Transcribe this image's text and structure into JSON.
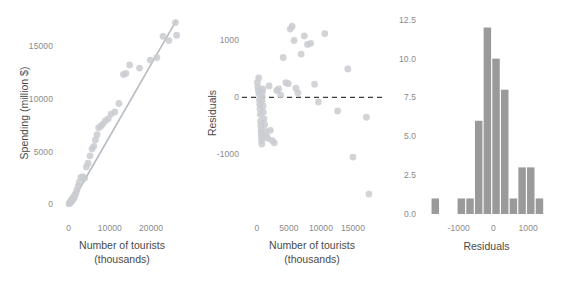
{
  "figure": {
    "background": "#ffffff",
    "point_color": "#c9cbd0",
    "line_color": "#b7bbc2",
    "bar_color": "#9a9a9a",
    "ref_line_color": "#3d3d3d",
    "tick_color": "#8a8a8a",
    "title_color": "#4a4a4a"
  },
  "chart_data": [
    {
      "id": "panel-scatter",
      "type": "scatter",
      "title": "",
      "xlabel": "Number of tourists",
      "xlabel_sub": "(thousands)",
      "ylabel": "Spending (million $)",
      "xticks": [
        0,
        10000,
        20000
      ],
      "xtick_labels": [
        "0",
        "10000",
        "20000"
      ],
      "yticks": [
        0,
        5000,
        10000,
        15000
      ],
      "ytick_labels": [
        "0",
        "5000",
        "10000",
        "15000"
      ],
      "xlim": [
        -1600,
        27500
      ],
      "ylim": [
        -900,
        18200
      ],
      "grid": false,
      "has_fit_line": true,
      "fit_line": {
        "x0": 300,
        "y0": -120,
        "x1": 26200,
        "y1": 17450
      },
      "x": [
        120,
        250,
        330,
        420,
        520,
        610,
        700,
        820,
        900,
        1050,
        1200,
        1350,
        1500,
        1750,
        1980,
        2300,
        2600,
        3000,
        3400,
        3900,
        4300,
        4700,
        5200,
        5700,
        6100,
        6500,
        6900,
        7300,
        7800,
        8300,
        8900,
        9600,
        10300,
        11200,
        12200,
        13300,
        13900,
        14800,
        17200,
        19800,
        21400,
        22900,
        24300,
        25900,
        26200
      ],
      "y": [
        60,
        120,
        200,
        180,
        320,
        260,
        420,
        380,
        560,
        480,
        700,
        620,
        880,
        1050,
        1320,
        1700,
        2100,
        2550,
        2620,
        2500,
        3550,
        3900,
        4600,
        5250,
        5500,
        6100,
        6600,
        7250,
        7400,
        7600,
        7900,
        8100,
        8550,
        8750,
        9550,
        12300,
        12400,
        13200,
        12900,
        13650,
        13900,
        15900,
        15500,
        17200,
        16000
      ]
    },
    {
      "id": "panel-resid",
      "type": "scatter",
      "title": "",
      "xlabel": "Number of tourists",
      "xlabel_sub": "(thousands)",
      "ylabel": "Residuals",
      "xticks": [
        0,
        5000,
        10000,
        15000
      ],
      "xtick_labels": [
        "0",
        "5000",
        "10000",
        "15000"
      ],
      "yticks": [
        -1000,
        0,
        1000
      ],
      "ytick_labels": [
        "-1000",
        "0",
        "1000"
      ],
      "xlim": [
        -1400,
        18600
      ],
      "ylim": [
        -2050,
        1500
      ],
      "grid": false,
      "reference_line": {
        "y": 0,
        "style": "dashed"
      },
      "x": [
        60,
        140,
        200,
        260,
        320,
        380,
        430,
        480,
        520,
        560,
        600,
        640,
        680,
        700,
        730,
        760,
        790,
        820,
        860,
        900,
        950,
        1000,
        1100,
        1200,
        1350,
        1500,
        1700,
        1900,
        2100,
        2400,
        2700,
        3100,
        3400,
        3700,
        4100,
        4500,
        4900,
        5200,
        5500,
        5800,
        6100,
        6400,
        6900,
        7400,
        7900,
        8400,
        9000,
        9600,
        10600,
        12600,
        14200,
        15000,
        17100,
        17500
      ],
      "y": [
        260,
        180,
        120,
        340,
        60,
        -40,
        -120,
        -200,
        -300,
        -420,
        -500,
        -580,
        -640,
        -700,
        -760,
        -820,
        -60,
        10,
        90,
        150,
        -150,
        -260,
        -380,
        -480,
        -600,
        -680,
        -720,
        200,
        -580,
        -760,
        -800,
        120,
        150,
        40,
        700,
        260,
        240,
        1200,
        1250,
        1000,
        160,
        80,
        760,
        1080,
        930,
        950,
        230,
        -80,
        1120,
        -240,
        500,
        -1050,
        -350,
        -1700
      ]
    },
    {
      "id": "panel-hist",
      "type": "bar",
      "title": "",
      "xlabel": "Residuals",
      "ylabel": "",
      "xticks": [
        -1000,
        0,
        1000
      ],
      "xtick_labels": [
        "-1000",
        "0",
        "1000"
      ],
      "yticks": [
        0.0,
        2.5,
        5.0,
        7.5,
        10.0,
        12.5
      ],
      "ytick_labels": [
        "0.0",
        "2.5",
        "5.0",
        "7.5",
        "10.0",
        "12.5"
      ],
      "xlim": [
        -2000,
        1600
      ],
      "ylim": [
        0,
        13.0
      ],
      "grid": false,
      "bin_width": 250,
      "bin_starts": [
        -1800,
        -1550,
        -1300,
        -1050,
        -800,
        -550,
        -300,
        -50,
        200,
        450,
        700,
        950,
        1200
      ],
      "categories": [
        "-1800",
        "-1550",
        "-1300",
        "-1050",
        "-800",
        "-550",
        "-300",
        "-50",
        "200",
        "450",
        "700",
        "950",
        "1200"
      ],
      "values": [
        1,
        0,
        0,
        1,
        1,
        6,
        12,
        10,
        8,
        1,
        3,
        3,
        1
      ]
    }
  ]
}
